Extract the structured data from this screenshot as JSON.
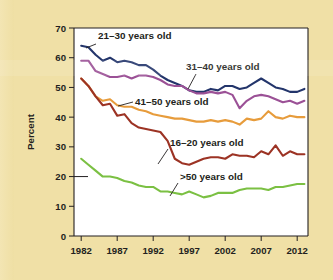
{
  "chart_data": {
    "type": "line",
    "title": "",
    "subtitle": "",
    "xlabel": "",
    "ylabel": "Percent",
    "xlim": [
      1981,
      2013.5
    ],
    "ylim": [
      0,
      70
    ],
    "yticks": [
      0,
      10,
      20,
      30,
      40,
      50,
      60,
      70
    ],
    "xticks": [
      1982,
      1987,
      1992,
      1997,
      2002,
      2007,
      2012
    ],
    "xtick_labels": [
      "1982",
      "1987",
      "1992",
      "1997",
      "2002",
      "2007",
      "2012"
    ],
    "ytick_labels": [
      "0",
      "10",
      "20",
      "30",
      "40",
      "50",
      "60",
      "70"
    ],
    "grid": false,
    "legend_position": "inline-annotations",
    "x": [
      1982,
      1983,
      1984,
      1985,
      1986,
      1987,
      1988,
      1989,
      1990,
      1991,
      1992,
      1993,
      1994,
      1995,
      1996,
      1997,
      1998,
      1999,
      2000,
      2001,
      2002,
      2003,
      2004,
      2005,
      2006,
      2007,
      2008,
      2009,
      2010,
      2011,
      2012,
      2013
    ],
    "series": [
      {
        "name": "21–30 years old",
        "color": "#23356b",
        "label": "21–30 years old",
        "values": [
          64.0,
          63.5,
          61.0,
          59.0,
          60.0,
          58.5,
          59.0,
          58.5,
          57.5,
          57.5,
          56.0,
          54.0,
          52.5,
          51.5,
          50.5,
          49.0,
          48.5,
          48.5,
          49.5,
          49.0,
          50.5,
          50.5,
          49.5,
          50.0,
          51.5,
          53.0,
          51.5,
          50.0,
          49.5,
          48.5,
          48.5,
          49.5
        ]
      },
      {
        "name": "31–40 years old",
        "color": "#9b5196",
        "label": "31–40 years old",
        "values": [
          59.0,
          59.0,
          55.5,
          54.5,
          53.5,
          53.5,
          54.0,
          53.0,
          54.0,
          54.0,
          53.5,
          52.5,
          51.0,
          50.5,
          50.5,
          49.0,
          48.0,
          48.0,
          48.5,
          48.0,
          48.5,
          47.5,
          43.0,
          45.5,
          47.0,
          47.5,
          47.0,
          46.0,
          45.0,
          45.5,
          44.5,
          45.5
        ]
      },
      {
        "name": "41–50 years old",
        "color": "#e79c3c",
        "label": "41–50 years old",
        "values": [
          53.0,
          50.5,
          47.0,
          45.5,
          46.0,
          44.0,
          43.5,
          43.5,
          42.5,
          42.0,
          41.0,
          40.5,
          40.0,
          39.5,
          39.5,
          39.0,
          38.5,
          38.5,
          39.0,
          38.5,
          39.0,
          38.5,
          37.5,
          39.5,
          39.0,
          39.5,
          42.0,
          40.0,
          39.5,
          40.5,
          40.0,
          40.0
        ]
      },
      {
        "name": "16–20 years old",
        "color": "#9c3324",
        "label": "16–20 years old",
        "values": [
          53.0,
          50.5,
          47.0,
          44.0,
          44.5,
          40.5,
          41.0,
          38.0,
          36.5,
          36.0,
          35.5,
          35.0,
          32.0,
          26.0,
          24.5,
          24.0,
          25.0,
          26.0,
          26.5,
          26.5,
          26.0,
          27.5,
          27.0,
          27.0,
          26.5,
          28.5,
          27.5,
          30.5,
          27.0,
          28.5,
          27.5,
          27.5
        ]
      },
      {
        "name": ">50 years old",
        "color": "#7bc043",
        "label": ">50 years old",
        "values": [
          26.0,
          24.0,
          22.0,
          20.0,
          20.0,
          19.5,
          18.5,
          18.0,
          17.0,
          16.5,
          16.5,
          15.0,
          15.0,
          14.5,
          14.0,
          15.0,
          14.0,
          13.0,
          13.5,
          14.5,
          14.5,
          14.5,
          15.5,
          16.0,
          16.0,
          16.0,
          15.5,
          16.5,
          16.5,
          17.0,
          17.5,
          17.5
        ]
      }
    ],
    "annotations": [
      {
        "label": "21–30 years old",
        "series": "21–30 years old",
        "x": 98,
        "y": 39,
        "leader_from": [
          96,
          44
        ],
        "leader_to": [
          86,
          48
        ]
      },
      {
        "label": "31–40 years old",
        "series": "31–40 years old",
        "x": 186,
        "y": 70,
        "leader_from": [
          196,
          74
        ],
        "leader_to": [
          188,
          89
        ]
      },
      {
        "label": "41–50 years old",
        "series": "41–50 years old",
        "x": 135,
        "y": 105,
        "leader_from": [
          133,
          102
        ],
        "leader_to": [
          118,
          106
        ]
      },
      {
        "label": "16–20 years old",
        "series": "16–20 years old",
        "x": 170,
        "y": 146,
        "leader_from": [
          168,
          149
        ],
        "leader_to": [
          158,
          164
        ]
      },
      {
        "label": ">50 years old",
        "series": ">50 years old",
        "x": 180,
        "y": 180,
        "leader_from": [
          178,
          183
        ],
        "leader_to": [
          170,
          196
        ]
      }
    ]
  },
  "figure": {
    "background_color": "#f0e0a6",
    "plot_background_color": "#ffffff",
    "axis_color": "#231f20"
  }
}
